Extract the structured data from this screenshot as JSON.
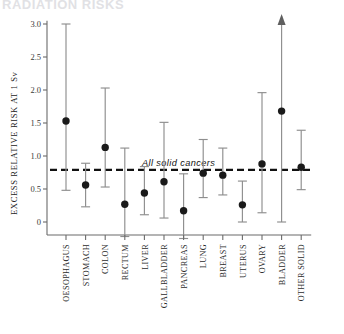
{
  "figure": {
    "title_fragment": "RADIATION RISKS",
    "annotation": "All solid cancers",
    "ylabel": "EXCESS  RELATIVE  RISK  AT  1  Sv"
  },
  "chart_data": {
    "type": "scatter",
    "title": "",
    "xlabel": "",
    "ylabel": "EXCESS  RELATIVE  RISK  AT  1  Sv",
    "ylim": [
      -0.35,
      3.15
    ],
    "yticks": [
      0,
      0.5,
      1.0,
      1.5,
      2.0,
      2.5,
      3.0
    ],
    "ytick_labels": [
      "0",
      "0.5",
      "1.0",
      "1.5",
      "2.0",
      "2.5",
      "3.0"
    ],
    "grid": false,
    "legend": "none",
    "reference_line": {
      "label": "All solid cancers",
      "value": 0.79,
      "style": "dashed",
      "color": "#111111"
    },
    "categories": [
      "OESOPHAGUS",
      "STOMACH",
      "COLON",
      "RECTUM",
      "LIVER",
      "GALLBLADDER",
      "PANCREAS",
      "LUNG",
      "BREAST",
      "UTERUS",
      "OVARY",
      "BLADDER",
      "OTHER SOLID"
    ],
    "values": [
      1.53,
      0.56,
      1.13,
      0.27,
      0.44,
      0.61,
      0.17,
      0.74,
      0.71,
      0.26,
      0.88,
      1.68,
      0.83
    ],
    "ci_low": [
      0.48,
      0.23,
      0.53,
      -0.22,
      0.11,
      0.06,
      -0.25,
      0.37,
      0.41,
      0.0,
      0.14,
      0.0,
      0.49
    ],
    "ci_high": [
      3.0,
      0.89,
      2.03,
      1.12,
      0.84,
      1.51,
      0.73,
      1.25,
      1.12,
      0.62,
      1.96,
      3.12,
      1.39
    ],
    "ci_high_open": [
      false,
      false,
      false,
      false,
      false,
      false,
      false,
      false,
      false,
      false,
      false,
      true,
      false
    ],
    "series_note": "point estimate with 90% confidence interval; arrow denotes upper bound beyond axis"
  }
}
